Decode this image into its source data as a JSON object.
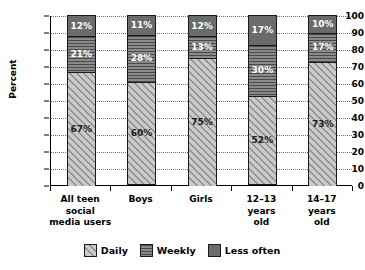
{
  "chart_data": {
    "type": "bar",
    "subtype": "stacked-bar-100",
    "title": "",
    "xlabel": "",
    "ylabel": "Percent",
    "ylim": [
      0,
      100
    ],
    "yticks": [
      0,
      10,
      20,
      30,
      40,
      50,
      60,
      70,
      80,
      90,
      100
    ],
    "ytick_labels": [
      "0",
      "10",
      "20",
      "30",
      "40",
      "50",
      "60",
      "70",
      "80",
      "90",
      "100"
    ],
    "grid": "horizontal-dotted",
    "legend_position": "bottom-center",
    "categories": [
      "All teen\nsocial\nmedia users",
      "Boys",
      "Girls",
      "12–13\nyears\nold",
      "14–17\nyears\nold"
    ],
    "series": [
      {
        "name": "Daily",
        "pattern": "diagonal-hatch",
        "color": "#c9c9c9",
        "values": [
          67,
          60,
          75,
          52,
          73
        ],
        "labels": [
          "67%",
          "60%",
          "75%",
          "52%",
          "73%"
        ]
      },
      {
        "name": "Weekly",
        "pattern": "horizontal-lines",
        "color": "#8a8a8a",
        "values": [
          21,
          28,
          13,
          30,
          17
        ],
        "labels": [
          "21%",
          "28%",
          "13%",
          "30%",
          "17%"
        ]
      },
      {
        "name": "Less often",
        "pattern": "solid",
        "color": "#6b6b6b",
        "values": [
          12,
          11,
          12,
          17,
          10
        ],
        "labels": [
          "12%",
          "11%",
          "12%",
          "17%",
          "10%"
        ]
      }
    ]
  },
  "legend": {
    "items": [
      {
        "label": "Daily"
      },
      {
        "label": "Weekly"
      },
      {
        "label": "Less often"
      }
    ]
  }
}
